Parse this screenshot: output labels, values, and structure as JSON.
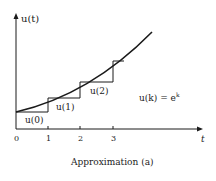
{
  "figure": {
    "y_axis_label": "u(t)",
    "x_axis_label": "t",
    "x_ticks": [
      "0",
      "1",
      "2",
      "3"
    ],
    "step_labels": [
      "u(0)",
      "u(1)",
      "u(2)"
    ],
    "formula": "u(k) = e",
    "formula_exponent": "k",
    "caption": "Approximation (a)"
  },
  "colors": {
    "line": "#1a1a1a",
    "background": "#ffffff"
  }
}
